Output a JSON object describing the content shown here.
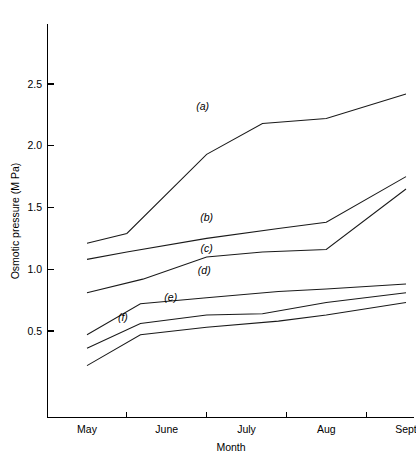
{
  "chart_data": {
    "type": "line",
    "title": "",
    "xlabel": "Month",
    "ylabel": "Osmotic pressure (M Pa)",
    "categories": [
      "May",
      "June",
      "July",
      "Aug",
      "Sept"
    ],
    "x_tick_labels": [
      "May",
      "June",
      "July",
      "Aug",
      "Sept"
    ],
    "y_tick_labels": [
      "0.5",
      "1.0",
      "1.5",
      "2.0",
      "2.5"
    ],
    "y_ticks": [
      0.5,
      1.0,
      1.5,
      2.0,
      2.5
    ],
    "ylim": [
      0.15,
      2.85
    ],
    "grid": false,
    "legend_position": "inline-curve-labels",
    "series": [
      {
        "name": "(a)",
        "label": "(a)",
        "label_x": 2.45,
        "label_y": 2.29,
        "x": [
          1.0,
          1.5,
          2.5,
          3.2,
          4.0,
          5.0
        ],
        "values": [
          1.21,
          1.29,
          1.93,
          2.18,
          2.22,
          2.42
        ]
      },
      {
        "name": "(b)",
        "label": "(b)",
        "label_x": 2.5,
        "label_y": 1.39,
        "x": [
          1.0,
          1.5,
          2.5,
          3.4,
          4.0,
          5.0
        ],
        "values": [
          1.08,
          1.14,
          1.25,
          1.33,
          1.38,
          1.75
        ]
      },
      {
        "name": "(c)",
        "label": "(c)",
        "label_x": 2.5,
        "label_y": 1.14,
        "x": [
          1.0,
          1.7,
          2.5,
          3.2,
          4.0,
          5.0
        ],
        "values": [
          0.81,
          0.92,
          1.1,
          1.14,
          1.16,
          1.65
        ]
      },
      {
        "name": "(d)",
        "label": "(d)",
        "label_x": 2.47,
        "label_y": 0.96,
        "x": [
          1.0,
          1.67,
          2.5,
          3.4,
          4.0,
          5.0
        ],
        "values": [
          0.47,
          0.72,
          0.77,
          0.82,
          0.84,
          0.88
        ]
      },
      {
        "name": "(e)",
        "label": "(e)",
        "label_x": 2.05,
        "label_y": 0.74,
        "x": [
          1.0,
          1.67,
          2.5,
          3.2,
          4.0,
          5.0
        ],
        "values": [
          0.36,
          0.56,
          0.63,
          0.64,
          0.73,
          0.81
        ]
      },
      {
        "name": "(f)",
        "label": "(f)",
        "label_x": 1.45,
        "label_y": 0.58,
        "x": [
          1.0,
          1.67,
          2.5,
          3.4,
          4.0,
          5.0
        ],
        "values": [
          0.22,
          0.47,
          0.53,
          0.58,
          0.63,
          0.73
        ]
      }
    ]
  },
  "colors": {
    "axis": "#000000",
    "line": "#1a1a1a",
    "background": "#ffffff"
  }
}
